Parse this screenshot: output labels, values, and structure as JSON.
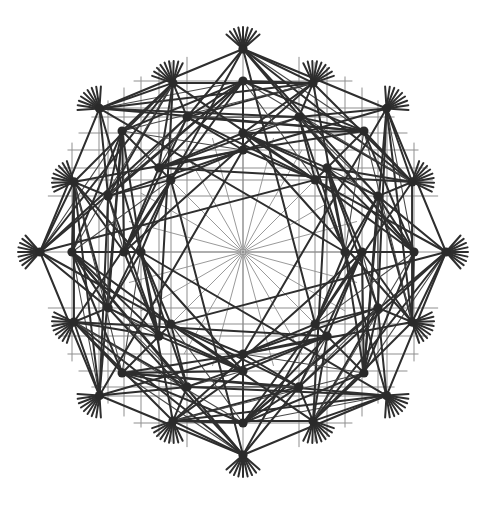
{
  "figure": {
    "background_color": "#ffffff",
    "canvas": {
      "width": 489,
      "height": 510
    }
  },
  "style": {
    "edge_color": "#2e2e2e",
    "edge_color_mid": "#4a4a4a",
    "spoke_color": "#9a9a9a",
    "axis_color": "#8f8f8f",
    "vertex_color": "#2a2a2a",
    "edge_width": 2.0,
    "thin_edge_width": 1.1,
    "spoke_width": 1.0,
    "vertex_radius": 4.6,
    "center_dot_radius": 1.2
  },
  "geometry": {
    "center": {
      "x": 243,
      "y": 252
    },
    "symmetry_order": 8,
    "ring_count": 6,
    "vertices_per_ring": 8,
    "total_vertices": 48,
    "rings": [
      {
        "name": "ring-1-inner",
        "radius": 102,
        "phase_deg": 45,
        "note": "innermost square-corner ring"
      },
      {
        "name": "ring-2",
        "radius": 119,
        "phase_deg": 0,
        "note": "axis-aligned ring"
      },
      {
        "name": "ring-3",
        "radius": 146,
        "phase_deg": 22.5
      },
      {
        "name": "ring-4",
        "radius": 171,
        "phase_deg": 45
      },
      {
        "name": "ring-5",
        "radius": 183,
        "phase_deg": 67.5
      },
      {
        "name": "ring-6-outer",
        "radius": 203,
        "phase_deg": 0,
        "note": "outermost points on the 4 axes and diagonals"
      }
    ],
    "spokes": {
      "count": 24,
      "inner_radius": 2,
      "outer_radius": 118
    },
    "vertex_whiskers": {
      "count_per_outer_vertex": 9,
      "length": 22
    }
  },
  "labels": {
    "has_text": false,
    "has_axes": false,
    "has_legend": false,
    "has_title_text": false
  }
}
